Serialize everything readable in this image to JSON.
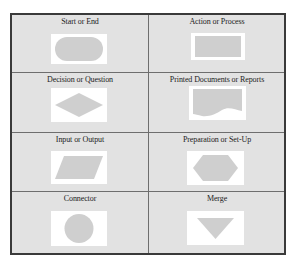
{
  "colors": {
    "table_background": "#e2e2e2",
    "border": "#3a3a3a",
    "grid_line": "#6e6e6e",
    "shape_fill": "#cfcfcf",
    "shape_box": "#ffffff"
  },
  "symbols": [
    {
      "label": "Start or End",
      "shape": "terminal-rounded-rectangle"
    },
    {
      "label": "Action or Process",
      "shape": "rectangle"
    },
    {
      "label": "Decision or Question",
      "shape": "diamond"
    },
    {
      "label": "Printed Documents or Reports",
      "shape": "document"
    },
    {
      "label": "Input or Output",
      "shape": "parallelogram"
    },
    {
      "label": "Preparation or Set-Up",
      "shape": "hexagon"
    },
    {
      "label": "Connector",
      "shape": "circle"
    },
    {
      "label": "Merge",
      "shape": "inverted-triangle"
    }
  ]
}
